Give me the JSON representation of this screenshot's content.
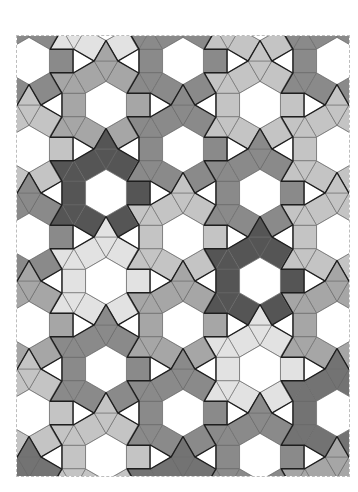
{
  "figure": {
    "frame": {
      "x": 17,
      "y": 36,
      "width": 332,
      "height": 440
    },
    "hexagon_edge": 23.6,
    "shades": {
      "VL": "#e2e2e2",
      "L": "#c4c4c4",
      "M": "#a6a6a6",
      "MD": "#8a8a8a",
      "D": "#737373",
      "VD": "#555555"
    },
    "center_fill": "#ffffff",
    "gap_fill": "#ffffff",
    "inner_line_color": "#6e6e6e",
    "outline_color": "#1e1e1e",
    "dodecagons": [
      {
        "x": 29,
        "y": 61,
        "shade": "MD"
      },
      {
        "x": 29,
        "y": 149,
        "shade": "L"
      },
      {
        "x": 29,
        "y": 237,
        "shade": "MD"
      },
      {
        "x": 29,
        "y": 325,
        "shade": "M"
      },
      {
        "x": 29,
        "y": 413,
        "shade": "L"
      },
      {
        "x": 29,
        "y": 501,
        "shade": "D"
      },
      {
        "x": 106,
        "y": 17,
        "shade": "VL"
      },
      {
        "x": 106,
        "y": 105,
        "shade": "M"
      },
      {
        "x": 106,
        "y": 193,
        "shade": "VD"
      },
      {
        "x": 106,
        "y": 281,
        "shade": "VL"
      },
      {
        "x": 106,
        "y": 369,
        "shade": "MD"
      },
      {
        "x": 106,
        "y": 457,
        "shade": "L"
      },
      {
        "x": 183,
        "y": 61,
        "shade": "MD"
      },
      {
        "x": 183,
        "y": 149,
        "shade": "MD"
      },
      {
        "x": 183,
        "y": 237,
        "shade": "L"
      },
      {
        "x": 183,
        "y": 325,
        "shade": "M"
      },
      {
        "x": 183,
        "y": 413,
        "shade": "MD"
      },
      {
        "x": 183,
        "y": 501,
        "shade": "D"
      },
      {
        "x": 260,
        "y": 17,
        "shade": "L"
      },
      {
        "x": 260,
        "y": 105,
        "shade": "L"
      },
      {
        "x": 260,
        "y": 193,
        "shade": "MD"
      },
      {
        "x": 260,
        "y": 281,
        "shade": "VD"
      },
      {
        "x": 260,
        "y": 369,
        "shade": "VL"
      },
      {
        "x": 260,
        "y": 457,
        "shade": "MD"
      },
      {
        "x": 337,
        "y": 61,
        "shade": "MD"
      },
      {
        "x": 337,
        "y": 149,
        "shade": "L"
      },
      {
        "x": 337,
        "y": 237,
        "shade": "L"
      },
      {
        "x": 337,
        "y": 325,
        "shade": "M"
      },
      {
        "x": 337,
        "y": 413,
        "shade": "D"
      },
      {
        "x": 337,
        "y": 501,
        "shade": "M"
      }
    ]
  }
}
